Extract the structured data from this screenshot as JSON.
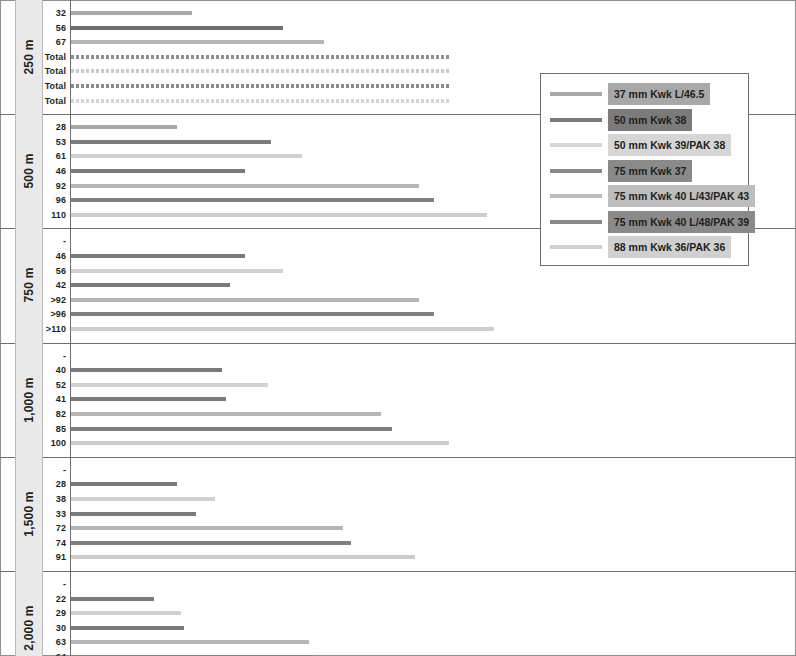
{
  "chart_data": {
    "type": "bar",
    "title": "",
    "xlabel": "",
    "ylabel": "",
    "orientation": "horizontal",
    "grid": false,
    "xlim": [
      0,
      120
    ],
    "legend_position": "right",
    "legend": [
      {
        "label": "37 mm Kwk L/46.5",
        "color": "#a8a8a8"
      },
      {
        "label": "50 mm Kwk 38",
        "color": "#7b7b7b"
      },
      {
        "label": "50 mm Kwk 39/PAK 38",
        "color": "#d6d6d6"
      },
      {
        "label": "75 mm Kwk 37",
        "color": "#8a8a8a"
      },
      {
        "label": "75 mm Kwk 40 L/43/PAK 43",
        "color": "#bdbdbd"
      },
      {
        "label": "75 mm Kwk 40 L/48/PAK 39",
        "color": "#8a8a8a"
      },
      {
        "label": "88 mm Kwk 36/PAK 36",
        "color": "#d0d0d0"
      }
    ],
    "groups": [
      {
        "label": "250 m",
        "rows": [
          {
            "label": "32",
            "value": 32,
            "style": "solid",
            "color": "#a8a8a8"
          },
          {
            "label": "56",
            "value": 56,
            "style": "solid",
            "color": "#6f6f6f"
          },
          {
            "label": "67",
            "value": 67,
            "style": "solid",
            "color": "#b5b5b5"
          },
          {
            "label": "Total",
            "value": 100,
            "style": "dashed",
            "color": "#8f8f8f"
          },
          {
            "label": "Total",
            "value": 100,
            "style": "dashed",
            "color": "#c9c9c9"
          },
          {
            "label": "Total",
            "value": 100,
            "style": "dashed",
            "color": "#8a8a8a"
          },
          {
            "label": "Total",
            "value": 100,
            "style": "dashed",
            "color": "#d4d4d4"
          }
        ]
      },
      {
        "label": "500 m",
        "rows": [
          {
            "label": "28",
            "value": 28,
            "style": "solid",
            "color": "#a8a8a8"
          },
          {
            "label": "53",
            "value": 53,
            "style": "solid",
            "color": "#7b7b7b"
          },
          {
            "label": "61",
            "value": 61,
            "style": "solid",
            "color": "#d0d0d0"
          },
          {
            "label": "46",
            "value": 46,
            "style": "solid",
            "color": "#7b7b7b"
          },
          {
            "label": "92",
            "value": 92,
            "style": "solid",
            "color": "#b5b5b5"
          },
          {
            "label": "96",
            "value": 96,
            "style": "solid",
            "color": "#808080"
          },
          {
            "label": "110",
            "value": 110,
            "style": "solid",
            "color": "#cdcdcd"
          }
        ]
      },
      {
        "label": "750 m",
        "rows": [
          {
            "label": "-",
            "value": 0,
            "style": "none",
            "color": "#a8a8a8"
          },
          {
            "label": "46",
            "value": 46,
            "style": "solid",
            "color": "#7b7b7b"
          },
          {
            "label": "56",
            "value": 56,
            "style": "solid",
            "color": "#d0d0d0"
          },
          {
            "label": "42",
            "value": 42,
            "style": "solid",
            "color": "#7b7b7b"
          },
          {
            "label": ">92",
            "value": 92,
            "style": "solid",
            "color": "#b5b5b5"
          },
          {
            "label": ">96",
            "value": 96,
            "style": "solid",
            "color": "#808080"
          },
          {
            "label": ">110",
            "value": 112,
            "style": "solid",
            "color": "#cdcdcd"
          }
        ]
      },
      {
        "label": "1,000 m",
        "rows": [
          {
            "label": "-",
            "value": 0,
            "style": "none",
            "color": "#a8a8a8"
          },
          {
            "label": "40",
            "value": 40,
            "style": "solid",
            "color": "#7b7b7b"
          },
          {
            "label": "52",
            "value": 52,
            "style": "solid",
            "color": "#d0d0d0"
          },
          {
            "label": "41",
            "value": 41,
            "style": "solid",
            "color": "#7b7b7b"
          },
          {
            "label": "82",
            "value": 82,
            "style": "solid",
            "color": "#b5b5b5"
          },
          {
            "label": "85",
            "value": 85,
            "style": "solid",
            "color": "#808080"
          },
          {
            "label": "100",
            "value": 100,
            "style": "solid",
            "color": "#cdcdcd"
          }
        ]
      },
      {
        "label": "1,500 m",
        "rows": [
          {
            "label": "-",
            "value": 0,
            "style": "none",
            "color": "#a8a8a8"
          },
          {
            "label": "28",
            "value": 28,
            "style": "solid",
            "color": "#7b7b7b"
          },
          {
            "label": "38",
            "value": 38,
            "style": "solid",
            "color": "#d0d0d0"
          },
          {
            "label": "33",
            "value": 33,
            "style": "solid",
            "color": "#7b7b7b"
          },
          {
            "label": "72",
            "value": 72,
            "style": "solid",
            "color": "#b5b5b5"
          },
          {
            "label": "74",
            "value": 74,
            "style": "solid",
            "color": "#808080"
          },
          {
            "label": "91",
            "value": 91,
            "style": "solid",
            "color": "#cdcdcd"
          }
        ]
      },
      {
        "label": "2,000 m",
        "rows": [
          {
            "label": "-",
            "value": 0,
            "style": "none",
            "color": "#a8a8a8"
          },
          {
            "label": "22",
            "value": 22,
            "style": "solid",
            "color": "#7b7b7b"
          },
          {
            "label": "29",
            "value": 29,
            "style": "solid",
            "color": "#d0d0d0"
          },
          {
            "label": "30",
            "value": 30,
            "style": "solid",
            "color": "#7b7b7b"
          },
          {
            "label": "63",
            "value": 63,
            "style": "solid",
            "color": "#b5b5b5"
          },
          {
            "label": "64",
            "value": 64,
            "style": "solid",
            "color": "#808080"
          },
          {
            "label": "84",
            "value": 84,
            "style": "solid",
            "color": "#cdcdcd"
          }
        ]
      }
    ]
  },
  "colors": {
    "frame": "#8e8e8e",
    "rule": "#6f6f6f",
    "group_band": "#e9e9e9",
    "text": "#231f20"
  }
}
